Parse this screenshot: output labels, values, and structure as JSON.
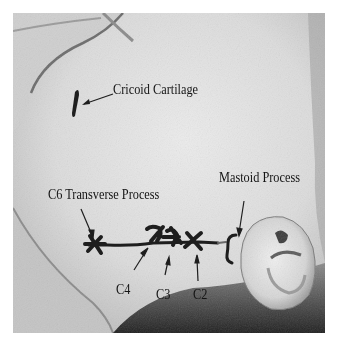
{
  "figure": {
    "type": "annotated grayscale photograph",
    "colors": {
      "background": "#ffffff",
      "skin_light": "#e4e4e4",
      "skin_mid": "#c8c8c8",
      "shadow": "#3a3a3a",
      "marker": "#1e1e1e"
    },
    "labels": {
      "cricoid": "Cricoid Cartilage",
      "c6": "C6 Transverse Process",
      "mastoid": "Mastoid Process",
      "c4": "C4",
      "c3": "C3",
      "c2": "C2"
    }
  }
}
